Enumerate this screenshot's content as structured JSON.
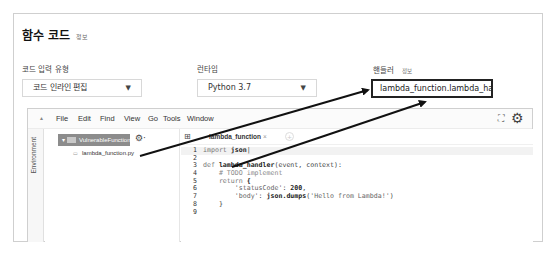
{
  "section": {
    "title": "함수 코드",
    "info_link": "정보"
  },
  "fields": {
    "code_entry_type": {
      "label": "코드 입력 유형",
      "value": "코드 인라인 편집",
      "arrow": "▼"
    },
    "runtime": {
      "label": "런타임",
      "value": "Python 3.7",
      "arrow": "▼"
    },
    "handler": {
      "label": "핸들러",
      "info_link": "정보",
      "value": "lambda_function.lambda_handl"
    }
  },
  "ide": {
    "menu": {
      "collapse_caret": "▲",
      "items": [
        "File",
        "Edit",
        "Find",
        "View",
        "Go",
        "Tools",
        "Window"
      ],
      "expand_icon": "⛶",
      "gear_icon": "⚙"
    },
    "environment_label": "Environment",
    "tree": {
      "folder": "VulnerableFunction",
      "folder_gear": "⚙·",
      "files": [
        "lambda_function.py"
      ]
    },
    "tabs": [
      {
        "label": "lambda_function",
        "close": "×"
      }
    ],
    "new_tab": "+",
    "code_lines": [
      {
        "n": "1",
        "text": "import json"
      },
      {
        "n": "2",
        "text": ""
      },
      {
        "n": "3",
        "text": "def lambda_handler(event, context):"
      },
      {
        "n": "4",
        "text": "    # TODO implement"
      },
      {
        "n": "5",
        "text": "    return {"
      },
      {
        "n": "6",
        "text": "        'statusCode': 200,"
      },
      {
        "n": "7",
        "text": "        'body': json.dumps('Hello from Lambda!')"
      },
      {
        "n": "8",
        "text": "    }"
      },
      {
        "n": "9",
        "text": ""
      }
    ]
  },
  "annotations": {
    "arrow_color": "#111111",
    "arrows": [
      {
        "from": "lambda_function.py",
        "to": "handler"
      },
      {
        "from": "lambda_handler",
        "to": "handler"
      }
    ]
  }
}
